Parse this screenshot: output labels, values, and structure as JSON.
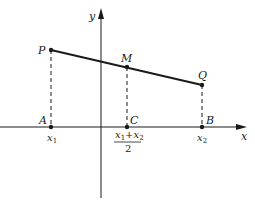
{
  "diagram": {
    "axes": {
      "x_label": "x",
      "y_label": "y"
    },
    "points": {
      "P": {
        "label": "P"
      },
      "M": {
        "label": "M"
      },
      "Q": {
        "label": "Q"
      },
      "A": {
        "label": "A"
      },
      "C": {
        "label": "C"
      },
      "B": {
        "label": "B"
      }
    },
    "ticks": {
      "x1": {
        "base": "x",
        "sub": "1"
      },
      "x2": {
        "base": "x",
        "sub": "2"
      },
      "mid": {
        "numerator_a": "x",
        "numerator_a_sub": "1",
        "plus": "+",
        "numerator_b": "x",
        "numerator_b_sub": "2",
        "denominator": "2"
      }
    },
    "colors": {
      "ink": "#1a1a1a",
      "background": "#ffffff"
    }
  }
}
